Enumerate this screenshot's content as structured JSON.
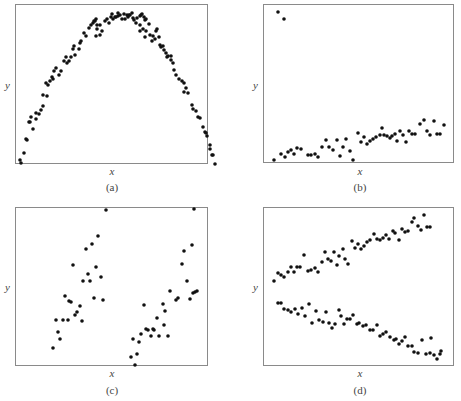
{
  "chart_data": [
    {
      "type": "scatter",
      "caption": "(a)",
      "xlabel": "x",
      "ylabel": "y",
      "grid": false,
      "description": "inverted-U (parabolic) relationship",
      "frame": {
        "left": 15,
        "top": 4,
        "width": 193,
        "height": 160
      },
      "points": [
        [
          4,
          155
        ],
        [
          5,
          158
        ],
        [
          8,
          148
        ],
        [
          10,
          134
        ],
        [
          11,
          135
        ],
        [
          13,
          117
        ],
        [
          14,
          117
        ],
        [
          17,
          124
        ],
        [
          15,
          112
        ],
        [
          20,
          114
        ],
        [
          20,
          108
        ],
        [
          23,
          109
        ],
        [
          25,
          105
        ],
        [
          27,
          101
        ],
        [
          27,
          90
        ],
        [
          31,
          91
        ],
        [
          32,
          80
        ],
        [
          30,
          78
        ],
        [
          34,
          76
        ],
        [
          36,
          72
        ],
        [
          38,
          66
        ],
        [
          37,
          74
        ],
        [
          40,
          63
        ],
        [
          43,
          70
        ],
        [
          45,
          66
        ],
        [
          48,
          56
        ],
        [
          50,
          52
        ],
        [
          51,
          58
        ],
        [
          53,
          56
        ],
        [
          55,
          52
        ],
        [
          57,
          44
        ],
        [
          59,
          50
        ],
        [
          58,
          41
        ],
        [
          63,
          44
        ],
        [
          64,
          38
        ],
        [
          65,
          36
        ],
        [
          68,
          28
        ],
        [
          70,
          31
        ],
        [
          73,
          23
        ],
        [
          75,
          20
        ],
        [
          77,
          18
        ],
        [
          78,
          16
        ],
        [
          79,
          16
        ],
        [
          81,
          20
        ],
        [
          80,
          14
        ],
        [
          80,
          31
        ],
        [
          81,
          24
        ],
        [
          84,
          30
        ],
        [
          84,
          20
        ],
        [
          86,
          26
        ],
        [
          89,
          16
        ],
        [
          91,
          14
        ],
        [
          93,
          18
        ],
        [
          95,
          12
        ],
        [
          97,
          14
        ],
        [
          96,
          9
        ],
        [
          99,
          12
        ],
        [
          100,
          12
        ],
        [
          102,
          8
        ],
        [
          102,
          11
        ],
        [
          104,
          10
        ],
        [
          106,
          14
        ],
        [
          108,
          9
        ],
        [
          109,
          14
        ],
        [
          111,
          10
        ],
        [
          112,
          12
        ],
        [
          113,
          10
        ],
        [
          114,
          10
        ],
        [
          116,
          8
        ],
        [
          117,
          13
        ],
        [
          118,
          15
        ],
        [
          121,
          13
        ],
        [
          120,
          18
        ],
        [
          124,
          11
        ],
        [
          125,
          10
        ],
        [
          126,
          9
        ],
        [
          128,
          12
        ],
        [
          129,
          15
        ],
        [
          130,
          14
        ],
        [
          133,
          19
        ],
        [
          124,
          26
        ],
        [
          124,
          20
        ],
        [
          127,
          24
        ],
        [
          129,
          32
        ],
        [
          130,
          26
        ],
        [
          134,
          30
        ],
        [
          137,
          31
        ],
        [
          136,
          36
        ],
        [
          139,
          34
        ],
        [
          140,
          26
        ],
        [
          141,
          24
        ],
        [
          143,
          32
        ],
        [
          144,
          40
        ],
        [
          145,
          42
        ],
        [
          147,
          41
        ],
        [
          148,
          45
        ],
        [
          150,
          48
        ],
        [
          151,
          52
        ],
        [
          152,
          51
        ],
        [
          155,
          51
        ],
        [
          155,
          55
        ],
        [
          157,
          58
        ],
        [
          158,
          65
        ],
        [
          160,
          70
        ],
        [
          163,
          74
        ],
        [
          166,
          76
        ],
        [
          168,
          78
        ],
        [
          168,
          87
        ],
        [
          170,
          83
        ],
        [
          172,
          88
        ],
        [
          176,
          100
        ],
        [
          177,
          104
        ],
        [
          180,
          106
        ],
        [
          182,
          112
        ],
        [
          184,
          113
        ],
        [
          187,
          122
        ],
        [
          189,
          127
        ],
        [
          190,
          128
        ],
        [
          191,
          131
        ],
        [
          194,
          140
        ],
        [
          194,
          144
        ],
        [
          196,
          150
        ],
        [
          197,
          150
        ],
        [
          199,
          159
        ]
      ]
    },
    {
      "type": "scatter",
      "caption": "(b)",
      "xlabel": "x",
      "ylabel": "y",
      "grid": false,
      "description": "weak positive linear trend with two high outliers at left",
      "frame": {
        "left": 263,
        "top": 4,
        "width": 191,
        "height": 159
      },
      "points": [
        [
          14,
          7
        ],
        [
          20,
          14
        ],
        [
          10,
          155
        ],
        [
          17,
          149
        ],
        [
          21,
          152
        ],
        [
          24,
          147
        ],
        [
          27,
          145
        ],
        [
          30,
          149
        ],
        [
          33,
          143
        ],
        [
          37,
          144
        ],
        [
          44,
          150
        ],
        [
          47,
          150
        ],
        [
          51,
          149
        ],
        [
          54,
          152
        ],
        [
          58,
          142
        ],
        [
          62,
          135
        ],
        [
          65,
          142
        ],
        [
          69,
          145
        ],
        [
          73,
          135
        ],
        [
          76,
          151
        ],
        [
          79,
          142
        ],
        [
          82,
          134
        ],
        [
          86,
          146
        ],
        [
          89,
          155
        ],
        [
          94,
          128
        ],
        [
          97,
          137
        ],
        [
          100,
          132
        ],
        [
          103,
          139
        ],
        [
          106,
          136
        ],
        [
          109,
          134
        ],
        [
          112,
          132
        ],
        [
          116,
          130
        ],
        [
          118,
          123
        ],
        [
          120,
          130
        ],
        [
          123,
          131
        ],
        [
          126,
          133
        ],
        [
          128,
          131
        ],
        [
          131,
          129
        ],
        [
          133,
          136
        ],
        [
          136,
          126
        ],
        [
          139,
          130
        ],
        [
          142,
          137
        ],
        [
          145,
          126
        ],
        [
          148,
          129
        ],
        [
          151,
          129
        ],
        [
          156,
          119
        ],
        [
          160,
          115
        ],
        [
          163,
          126
        ],
        [
          166,
          130
        ],
        [
          170,
          116
        ],
        [
          173,
          129
        ],
        [
          176,
          129
        ],
        [
          180,
          120
        ]
      ]
    },
    {
      "type": "scatter",
      "caption": "(c)",
      "xlabel": "x",
      "ylabel": "y",
      "grid": false,
      "description": "two separate clusters, each with positive linear trend",
      "frame": {
        "left": 15,
        "top": 207,
        "width": 193,
        "height": 159
      },
      "points": [
        [
          37,
          140
        ],
        [
          40,
          112
        ],
        [
          42,
          124
        ],
        [
          44,
          131
        ],
        [
          47,
          112
        ],
        [
          49,
          88
        ],
        [
          52,
          112
        ],
        [
          53,
          93
        ],
        [
          55,
          94
        ],
        [
          57,
          57
        ],
        [
          59,
          107
        ],
        [
          61,
          104
        ],
        [
          64,
          98
        ],
        [
          66,
          113
        ],
        [
          67,
          73
        ],
        [
          70,
          41
        ],
        [
          72,
          66
        ],
        [
          74,
          73
        ],
        [
          76,
          36
        ],
        [
          78,
          90
        ],
        [
          80,
          59
        ],
        [
          82,
          28
        ],
        [
          85,
          69
        ],
        [
          87,
          92
        ],
        [
          90,
          2
        ],
        [
          115,
          149
        ],
        [
          117,
          131
        ],
        [
          119,
          157
        ],
        [
          121,
          146
        ],
        [
          123,
          134
        ],
        [
          125,
          126
        ],
        [
          128,
          97
        ],
        [
          130,
          121
        ],
        [
          132,
          122
        ],
        [
          135,
          128
        ],
        [
          137,
          121
        ],
        [
          138,
          122
        ],
        [
          141,
          110
        ],
        [
          143,
          128
        ],
        [
          147,
          96
        ],
        [
          149,
          103
        ],
        [
          152,
          128
        ],
        [
          154,
          83
        ],
        [
          148,
          117
        ],
        [
          160,
          92
        ],
        [
          162,
          90
        ],
        [
          166,
          56
        ],
        [
          168,
          43
        ],
        [
          171,
          73
        ],
        [
          174,
          91
        ],
        [
          176,
          37
        ],
        [
          177,
          85
        ],
        [
          179,
          84
        ],
        [
          181,
          83
        ],
        [
          178,
          1
        ]
      ]
    },
    {
      "type": "scatter",
      "caption": "(d)",
      "xlabel": "x",
      "ylabel": "y",
      "grid": false,
      "description": "two diverging linear bands: one increasing, one decreasing",
      "frame": {
        "left": 263,
        "top": 207,
        "width": 191,
        "height": 159
      },
      "series": [
        {
          "name": "upper band (increasing)",
          "points": [
            [
              10,
              73
            ],
            [
              14,
              65
            ],
            [
              17,
              67
            ],
            [
              20,
              69
            ],
            [
              24,
              64
            ],
            [
              27,
              59
            ],
            [
              30,
              64
            ],
            [
              33,
              59
            ],
            [
              36,
              59
            ],
            [
              40,
              47
            ],
            [
              44,
              63
            ],
            [
              47,
              62
            ],
            [
              51,
              60
            ],
            [
              54,
              64
            ],
            [
              58,
              54
            ],
            [
              61,
              44
            ],
            [
              64,
              51
            ],
            [
              67,
              53
            ],
            [
              70,
              44
            ],
            [
              73,
              57
            ],
            [
              75,
              48
            ],
            [
              79,
              41
            ],
            [
              81,
              51
            ],
            [
              84,
              56
            ],
            [
              88,
              33
            ],
            [
              91,
              40
            ],
            [
              94,
              36
            ],
            [
              97,
              41
            ],
            [
              100,
              38
            ],
            [
              103,
              34
            ],
            [
              106,
              32
            ],
            [
              110,
              26
            ],
            [
              113,
              31
            ],
            [
              116,
              32
            ],
            [
              119,
              30
            ],
            [
              122,
              27
            ],
            [
              125,
              31
            ],
            [
              129,
              23
            ],
            [
              131,
              25
            ],
            [
              135,
              32
            ],
            [
              138,
              21
            ],
            [
              141,
              24
            ],
            [
              144,
              23
            ],
            [
              148,
              14
            ],
            [
              150,
              10
            ],
            [
              154,
              18
            ],
            [
              157,
              22
            ],
            [
              160,
              7
            ],
            [
              163,
              19
            ],
            [
              166,
              19
            ]
          ]
        },
        {
          "name": "lower band (decreasing)",
          "points": [
            [
              14,
              95
            ],
            [
              17,
              95
            ],
            [
              20,
              101
            ],
            [
              24,
              102
            ],
            [
              27,
              104
            ],
            [
              31,
              101
            ],
            [
              34,
              106
            ],
            [
              38,
              100
            ],
            [
              41,
              108
            ],
            [
              45,
              96
            ],
            [
              48,
              115
            ],
            [
              52,
              103
            ],
            [
              55,
              112
            ],
            [
              59,
              114
            ],
            [
              62,
              104
            ],
            [
              65,
              115
            ],
            [
              68,
              120
            ],
            [
              71,
              116
            ],
            [
              75,
              102
            ],
            [
              77,
              108
            ],
            [
              80,
              116
            ],
            [
              83,
              111
            ],
            [
              86,
              111
            ],
            [
              89,
              107
            ],
            [
              93,
              116
            ],
            [
              95,
              115
            ],
            [
              99,
              118
            ],
            [
              102,
              117
            ],
            [
              106,
              122
            ],
            [
              109,
              122
            ],
            [
              113,
              117
            ],
            [
              116,
              128
            ],
            [
              119,
              126
            ],
            [
              122,
              124
            ],
            [
              126,
              129
            ],
            [
              130,
              132
            ],
            [
              132,
              131
            ],
            [
              135,
              136
            ],
            [
              138,
              133
            ],
            [
              141,
              129
            ],
            [
              144,
              138
            ],
            [
              148,
              138
            ],
            [
              150,
              144
            ],
            [
              154,
              145
            ],
            [
              158,
              132
            ],
            [
              162,
              146
            ],
            [
              166,
              145
            ],
            [
              170,
              147
            ],
            [
              173,
              151
            ],
            [
              176,
              146
            ],
            [
              177,
              143
            ],
            [
              167,
              130
            ]
          ]
        }
      ]
    }
  ]
}
